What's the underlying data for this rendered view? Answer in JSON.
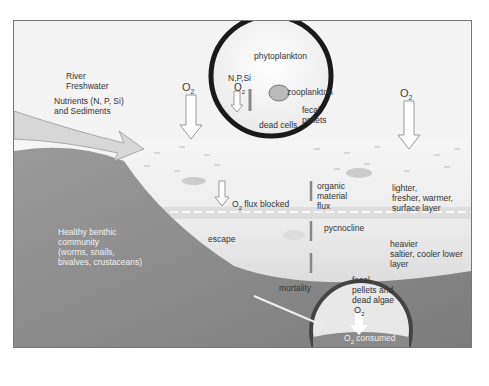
{
  "diagram": {
    "title_context": "Hypoxia / oxygen depletion in stratified coastal waters",
    "labels": {
      "river": "River\nFreshwater",
      "nutrients": "Nutrients (N, P, Si)\nand Sediments",
      "benthic": "Healthy benthic\ncommunity\n(worms, snails,\nbivalves, crustaceans)",
      "o2_flux_blocked": "flux blocked",
      "escape": "escape",
      "organic_flux": "organic\nmaterial\nflux",
      "pycnocline": "pycnocline",
      "surface_layer": "lighter,\nfresher, warmer,\nsurface layer",
      "lower_layer": "heavier\nsaltier, cooler lower\nlayer",
      "mortality": "mortality",
      "o2_left": "O",
      "o2_right": "O",
      "o2_sub": "2"
    },
    "inset_top": {
      "phytoplankton": "phytoplankton",
      "npsi": "N,P,Si",
      "o2": "O",
      "zooplankton": "zooplankton",
      "fecal": "fecal\npellets",
      "dead_cells": "dead cells"
    },
    "inset_bottom": {
      "fecal": "fecal\npellets and\ndead algae",
      "o2": "O",
      "consumed": "consumed"
    },
    "colors": {
      "water_top": "#f0f0f0",
      "water_bottom": "#d0d0d0",
      "sediment": "#8a8a8a",
      "circle_ring": "#222222"
    }
  }
}
